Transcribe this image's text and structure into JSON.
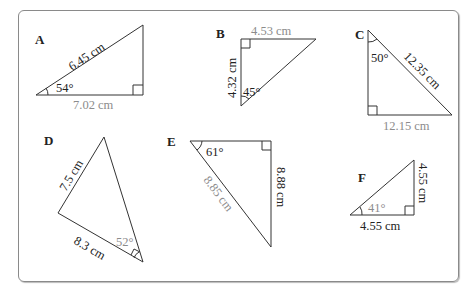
{
  "triangles": [
    {
      "id": "A",
      "label": "A",
      "hypotenuse": "6.45 cm",
      "base": "7.02 cm",
      "angle": "54°"
    },
    {
      "id": "B",
      "label": "B",
      "top": "4.53 cm",
      "side": "4.32 cm",
      "angle": "45°"
    },
    {
      "id": "C",
      "label": "C",
      "hypotenuse": "12.35 cm",
      "base": "12.15 cm",
      "angle": "50°"
    },
    {
      "id": "D",
      "label": "D",
      "left": "7.5 cm",
      "bottom": "8.3 cm",
      "angle": "52°"
    },
    {
      "id": "E",
      "label": "E",
      "hypotenuse": "8.85 cm",
      "side": "8.88 cm",
      "angle": "61°"
    },
    {
      "id": "F",
      "label": "F",
      "side": "4.55 cm",
      "base": "4.55 cm",
      "angle": "41°"
    }
  ]
}
